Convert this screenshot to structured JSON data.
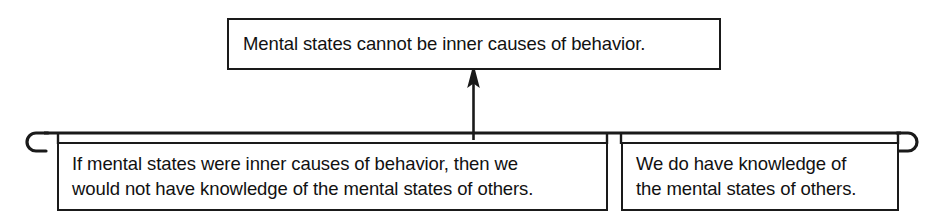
{
  "diagram": {
    "type": "argument-map",
    "ink_color": "#1a1a1a",
    "background_color": "#ffffff",
    "conclusion": {
      "id": "conclusion",
      "text": "Mental states cannot be inner causes of behavior."
    },
    "premises": [
      {
        "id": "premise-1",
        "text": "If mental states were inner causes of behavior, then we\nwould not have knowledge of the mental states of others."
      },
      {
        "id": "premise-2",
        "text": "We do have knowledge of\nthe mental states of others."
      }
    ],
    "connector": {
      "bracket_label": "linked-premise-bracket",
      "arrow_label": "inference-arrow",
      "arrow_direction": "up"
    }
  }
}
